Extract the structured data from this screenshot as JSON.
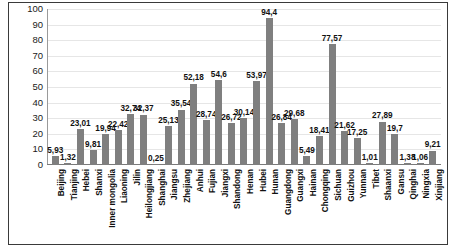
{
  "chart_data": {
    "type": "bar",
    "title": "",
    "subtitle": "",
    "xlabel": "",
    "ylabel": "",
    "ylim": [
      0,
      100
    ],
    "ytick_labels": [
      "100",
      "90",
      "80",
      "70",
      "60",
      "50",
      "40",
      "30",
      "20",
      "10",
      "0"
    ],
    "yticks": [
      100,
      90,
      80,
      70,
      60,
      50,
      40,
      30,
      20,
      10,
      0
    ],
    "grid": true,
    "legend": false,
    "legend_position": "none",
    "decimal_separator": ",",
    "bar_color": "#7f7f7f",
    "categories": [
      "Beijing",
      "Tianjing",
      "Hebei",
      "Shanxi",
      "Inner mongolia",
      "Liaoning",
      "Jilin",
      "Heilongjiang",
      "Shanghai",
      "Jiangsu",
      "Zhejiang",
      "Anhui",
      "Fujian",
      "Jiangxi",
      "Shandong",
      "Henan",
      "Hubei",
      "Hunan",
      "Guangdong",
      "Guangxi",
      "Hainan",
      "Chongqing",
      "Sichuan",
      "Guizhou",
      "Yunnan",
      "Tibet",
      "Shaanxi",
      "Gansu",
      "Qinghai",
      "Ningxia",
      "Xinjiang"
    ],
    "values": [
      5.93,
      1.32,
      23.01,
      9.81,
      19.94,
      22.42,
      32.74,
      32.37,
      0.25,
      25.13,
      35.54,
      52.18,
      28.74,
      54.6,
      26.72,
      30.14,
      53.97,
      94.4,
      26.84,
      29.68,
      5.49,
      18.41,
      77.57,
      21.62,
      17.25,
      1.01,
      27.89,
      19.7,
      1.38,
      1.06,
      9.21
    ],
    "value_labels": [
      "5,93",
      "1,32",
      "23,01",
      "9,81",
      "19,94",
      "22,42",
      "32,74",
      "32,37",
      "0,25",
      "25,13",
      "35,54",
      "52,18",
      "28,74",
      "54,6",
      "26,72",
      "30,14",
      "53,97",
      "94,4",
      "26,84",
      "29,68",
      "5,49",
      "18,41",
      "77,57",
      "21,62",
      "17,25",
      "1,01",
      "27,89",
      "19,7",
      "1,38",
      "1,06",
      "9,21"
    ]
  }
}
